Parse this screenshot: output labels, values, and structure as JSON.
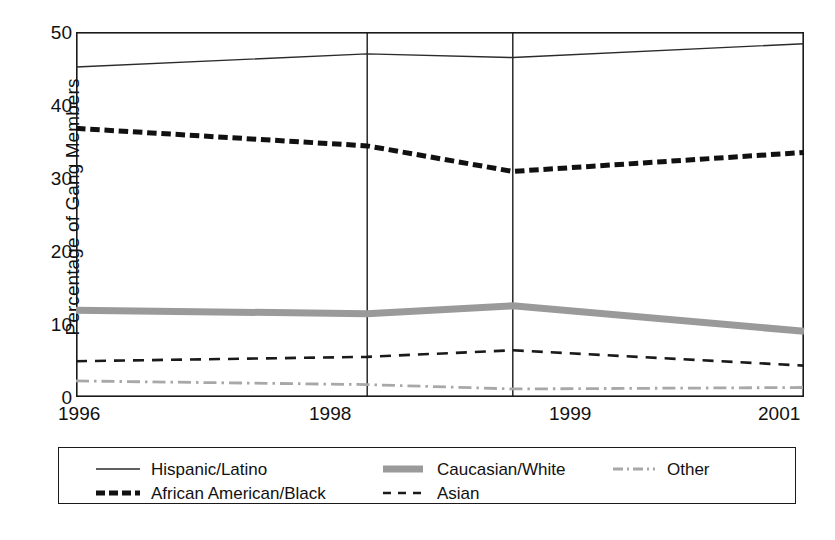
{
  "chart_data": {
    "type": "line",
    "title": "",
    "subtitle": "",
    "xlabel": "",
    "ylabel": "Percentage of Gang Members",
    "x": [
      "1996",
      "1998",
      "1999",
      "2001"
    ],
    "categories": [
      "1996",
      "1998",
      "1999",
      "2001"
    ],
    "xtick_labels": [
      "1996",
      "1998",
      "1999",
      "2001"
    ],
    "ytick_labels": [
      "0",
      "10",
      "20",
      "30",
      "40",
      "50"
    ],
    "yticks": [
      0,
      10,
      20,
      30,
      40,
      50
    ],
    "ylim": [
      0,
      50
    ],
    "xlim": [
      "1996",
      "2001"
    ],
    "grid": "vertical-gridlines-at-1998-and-1999",
    "legend_position": "below-plot",
    "series": [
      {
        "name": "Hispanic/Latino",
        "values": [
          45.2,
          47.0,
          46.5,
          48.4
        ],
        "color": "#2b2b2b",
        "style": "solid",
        "width": 1.4
      },
      {
        "name": "African American/Black",
        "values": [
          36.8,
          34.4,
          30.9,
          33.5
        ],
        "color": "#111111",
        "style": "dashed-thick",
        "width": 5
      },
      {
        "name": "Caucasian/White",
        "values": [
          11.9,
          11.4,
          12.5,
          9.0
        ],
        "color": "#9a9a9a",
        "style": "solid-thick",
        "width": 7
      },
      {
        "name": "Asian",
        "values": [
          4.9,
          5.5,
          6.4,
          4.3
        ],
        "color": "#1a1a1a",
        "style": "dashed-thin",
        "width": 2.6
      },
      {
        "name": "Other",
        "values": [
          2.2,
          1.7,
          1.1,
          1.3
        ],
        "color": "#a8a8a8",
        "style": "dash-dot",
        "width": 2.8
      }
    ]
  },
  "axes": {
    "y_title": "Percentage of Gang Members",
    "y_tick_0": "0",
    "y_tick_10": "10",
    "y_tick_20": "20",
    "y_tick_30": "30",
    "y_tick_40": "40",
    "y_tick_50": "50",
    "x_tick_0": "1996",
    "x_tick_1": "1998",
    "x_tick_2": "1999",
    "x_tick_3": "2001"
  },
  "legend": {
    "entries": [
      {
        "label": "Hispanic/Latino",
        "swatch": "thin-solid-black-line-icon"
      },
      {
        "label": "African American/Black",
        "swatch": "thick-dashed-black-line-icon"
      },
      {
        "label": "Caucasian/White",
        "swatch": "thick-solid-gray-line-icon"
      },
      {
        "label": "Asian",
        "swatch": "thin-dashed-black-line-icon"
      },
      {
        "label": "Other",
        "swatch": "gray-dash-dot-line-icon"
      }
    ]
  },
  "colors": {
    "ink": "#111111",
    "gray_series": "#9a9a9a",
    "other_series": "#a8a8a8",
    "frame": "#1a1a1a",
    "background": "#ffffff"
  }
}
